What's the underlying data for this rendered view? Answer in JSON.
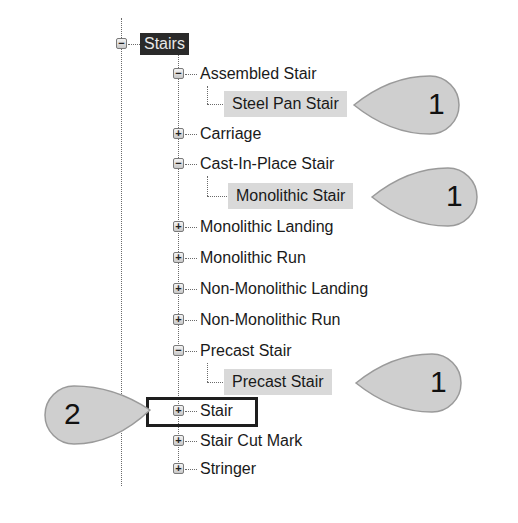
{
  "tree": {
    "root": {
      "label": "Stairs",
      "expanded": true
    },
    "items": [
      {
        "label": "Assembled Stair",
        "expanded": true,
        "children": [
          {
            "label": "Steel Pan Stair",
            "highlighted": true
          }
        ]
      },
      {
        "label": "Carriage",
        "expanded": false
      },
      {
        "label": "Cast-In-Place Stair",
        "expanded": true,
        "children": [
          {
            "label": "Monolithic Stair",
            "highlighted": true
          }
        ]
      },
      {
        "label": "Monolithic Landing",
        "expanded": false
      },
      {
        "label": "Monolithic Run",
        "expanded": false
      },
      {
        "label": "Non-Monolithic Landing",
        "expanded": false
      },
      {
        "label": "Non-Monolithic Run",
        "expanded": false
      },
      {
        "label": "Precast Stair",
        "expanded": true,
        "children": [
          {
            "label": "Precast Stair",
            "highlighted": true
          }
        ]
      },
      {
        "label": "Stair",
        "expanded": false,
        "boxed": true
      },
      {
        "label": "Stair Cut Mark",
        "expanded": false
      },
      {
        "label": "Stringer",
        "expanded": false
      }
    ]
  },
  "toggles": {
    "expanded": "−",
    "collapsed": "+"
  },
  "callouts": [
    {
      "number": "1",
      "target": "Steel Pan Stair"
    },
    {
      "number": "1",
      "target": "Monolithic Stair"
    },
    {
      "number": "1",
      "target": "Precast Stair"
    },
    {
      "number": "2",
      "target": "Stair"
    }
  ],
  "colors": {
    "root_bg": "#2a2a2a",
    "highlight_bg": "#d9d9d9",
    "callout_fill": "#cfcfcf"
  }
}
